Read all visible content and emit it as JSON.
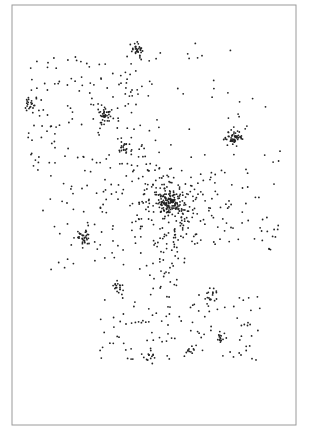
{
  "chart_data": {
    "type": "scatter",
    "title": "",
    "xlabel": "",
    "ylabel": "",
    "grid": false,
    "legend": null,
    "frame": {
      "x": 12,
      "y": 5,
      "width": 284,
      "height": 420,
      "stroke": "#9a9a9a"
    },
    "dot_color": "#222222",
    "dot_radius": 0.9,
    "clusters": [
      {
        "name": "central-hub",
        "cx": 170,
        "cy": 202,
        "r": 9,
        "n": 110
      },
      {
        "name": "hub-halo",
        "cx": 172,
        "cy": 205,
        "r": 38,
        "n": 230
      },
      {
        "name": "top",
        "cx": 138,
        "cy": 50,
        "r": 6,
        "n": 30
      },
      {
        "name": "left",
        "cx": 30,
        "cy": 105,
        "r": 6,
        "n": 22
      },
      {
        "name": "upper-middle",
        "cx": 106,
        "cy": 116,
        "r": 6,
        "n": 30
      },
      {
        "name": "upper-middle-2",
        "cx": 125,
        "cy": 146,
        "r": 6,
        "n": 22
      },
      {
        "name": "right",
        "cx": 234,
        "cy": 138,
        "r": 7,
        "n": 55
      },
      {
        "name": "left-mid",
        "cx": 84,
        "cy": 238,
        "r": 7,
        "n": 30
      },
      {
        "name": "small-lower",
        "cx": 117,
        "cy": 286,
        "r": 5,
        "n": 18
      },
      {
        "name": "bottom-right-small",
        "cx": 220,
        "cy": 338,
        "r": 4,
        "n": 12
      },
      {
        "name": "bottom-center",
        "cx": 190,
        "cy": 350,
        "r": 5,
        "n": 10
      },
      {
        "name": "bottom-left-small",
        "cx": 148,
        "cy": 355,
        "r": 6,
        "n": 14
      },
      {
        "name": "lower-arc",
        "cx": 210,
        "cy": 296,
        "r": 8,
        "n": 16
      }
    ],
    "diffuse_regions": [
      {
        "name": "upper-left-field",
        "x0": 28,
        "y0": 55,
        "x1": 160,
        "y1": 170,
        "n": 160
      },
      {
        "name": "upper-right-sparse",
        "x0": 160,
        "y0": 40,
        "x1": 270,
        "y1": 130,
        "n": 22
      },
      {
        "name": "left-mid-field",
        "x0": 40,
        "y0": 170,
        "x1": 150,
        "y1": 280,
        "n": 70
      },
      {
        "name": "right-mid-field",
        "x0": 210,
        "y0": 150,
        "x1": 280,
        "y1": 250,
        "n": 45
      },
      {
        "name": "lower-field",
        "x0": 100,
        "y0": 290,
        "x1": 260,
        "y1": 360,
        "n": 110
      },
      {
        "name": "hub-arm-down",
        "x0": 150,
        "y0": 230,
        "x1": 180,
        "y1": 300,
        "n": 35
      }
    ],
    "seed": 7
  }
}
